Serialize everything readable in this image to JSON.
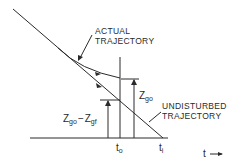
{
  "diagram": {
    "labels": {
      "actual_line1": "ACTUAL",
      "actual_line2": "TRAJECTORY",
      "undisturbed_line1": "UNDISTURBED",
      "undisturbed_line2": "TRAJECTORY",
      "zgo_base": "Z",
      "zgo_sub": "go",
      "diff_z1": "Z",
      "diff_sub1": "go",
      "diff_minus": "−",
      "diff_z2": "Z",
      "diff_sub2": "gf",
      "t0_base": "t",
      "t0_sub": "o",
      "ti_base": "t",
      "ti_sub": "i",
      "time_axis": "t",
      "time_arrow": "⟶"
    }
  }
}
